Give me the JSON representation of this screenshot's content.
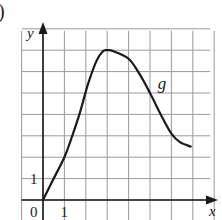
{
  "part_label": ")",
  "chart_data": {
    "type": "line",
    "title": "",
    "xlabel": "x",
    "ylabel": "y",
    "curve_label": "g",
    "grid": true,
    "xlim": [
      -1,
      8
    ],
    "ylim": [
      -1,
      8
    ],
    "x_ticks_labeled": [
      "0",
      "1"
    ],
    "y_ticks_labeled": [
      "1"
    ],
    "origin_label": "0",
    "series": [
      {
        "name": "g",
        "points": [
          [
            0,
            0
          ],
          [
            0.5,
            1.0
          ],
          [
            1,
            2
          ],
          [
            1.3,
            2.8
          ],
          [
            1.7,
            4
          ],
          [
            2.1,
            5.4
          ],
          [
            2.5,
            6.5
          ],
          [
            2.8,
            6.95
          ],
          [
            3.0,
            7.0
          ],
          [
            3.3,
            6.95
          ],
          [
            4,
            6.6
          ],
          [
            4.5,
            5.9
          ],
          [
            5,
            5.0
          ],
          [
            5.5,
            4.0
          ],
          [
            6,
            3.1
          ],
          [
            6.4,
            2.7
          ],
          [
            6.9,
            2.5
          ]
        ]
      }
    ],
    "annotations": [
      {
        "text": "g",
        "x": 5.5,
        "y": 5.4
      }
    ]
  }
}
